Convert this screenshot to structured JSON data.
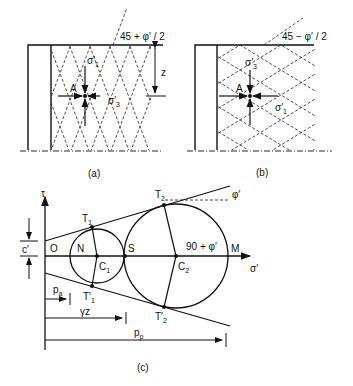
{
  "panel_a": {
    "caption": "(a)",
    "angle_label": "45 + φ′ / 2",
    "point_label": "A",
    "sigma1_label": "σ′",
    "sigma1_sub": "1",
    "sigma3_label": "σ′",
    "sigma3_sub": "3",
    "depth_label": "z"
  },
  "panel_b": {
    "caption": "(b)",
    "angle_label": "45 − φ′ / 2",
    "point_label": "A",
    "sigma3_label": "σ′",
    "sigma3_sub": "3",
    "sigma1_label": "σ′",
    "sigma1_sub": "1"
  },
  "panel_c": {
    "caption": "(c)",
    "tau_label": "τ",
    "sigma_axis_label": "σ′",
    "cohesion_label": "c′",
    "origin_label": "O",
    "N_label": "N",
    "S_label": "S",
    "M_label": "M",
    "C1_label": "C",
    "C1_sub": "1",
    "C2_label": "C",
    "C2_sub": "2",
    "T1_label": "T",
    "T1_sub": "1",
    "T1p_label": "T′",
    "T1p_sub": "1",
    "T2_label": "T",
    "T2_sub": "2",
    "T2p_label": "T′",
    "T2p_sub": "2",
    "phi_label": "φ′",
    "angle_label": "90 + φ′",
    "pa_label": "p",
    "pa_sub": "a",
    "gz_label": "γz",
    "pp_label": "p",
    "pp_sub": "p"
  }
}
